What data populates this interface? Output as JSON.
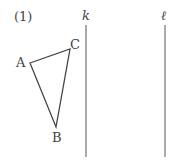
{
  "problem_number": "(1)",
  "lines": [
    {
      "name": "k",
      "x": 86,
      "y1": 25,
      "y2": 157
    },
    {
      "name": "ℓ",
      "x": 165,
      "y1": 25,
      "y2": 157
    }
  ],
  "triangle": {
    "vertices": [
      {
        "name": "A",
        "x": 30,
        "y": 63
      },
      {
        "name": "C",
        "x": 70,
        "y": 49
      },
      {
        "name": "B",
        "x": 56,
        "y": 127
      }
    ]
  },
  "colors": {
    "stroke": "#444444",
    "background": "#ffffff"
  }
}
